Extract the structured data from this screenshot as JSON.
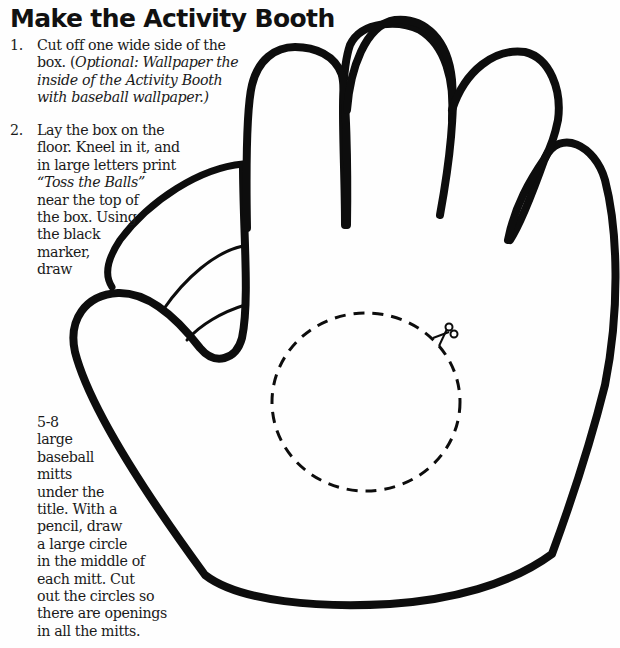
{
  "title": "Make the Activity Booth",
  "steps": [
    {
      "number": "1.",
      "lines": [
        {
          "text": "Cut off one wide side of the",
          "italic": ""
        },
        {
          "text": "box. (",
          "italic": "Optional: Wallpaper the"
        },
        {
          "text": "",
          "italic": "inside of the Activity Booth"
        },
        {
          "text": "",
          "italic": "with baseball wallpaper.)"
        }
      ]
    },
    {
      "number": "2.",
      "lines_top": [
        "Lay the box on the",
        "floor. Kneel in it, and",
        "in large letters print",
        "“Toss the Balls”",
        "near the top of",
        "the box. Using",
        "the black",
        "marker,",
        "draw"
      ],
      "lines_bottom": [
        "5-8",
        "large",
        "baseball",
        "mitts",
        "under the",
        "title. With a",
        "pencil, draw",
        "a large circle",
        "in the middle of",
        "each mitt. Cut",
        "out the circles so",
        "there are openings",
        "in all the mitts."
      ]
    }
  ],
  "illustration": {
    "subject": "baseball-mitt-outline",
    "cut_line": "dashed-circle",
    "icon": "scissors-icon",
    "ink_color": "#0d0d0d"
  }
}
